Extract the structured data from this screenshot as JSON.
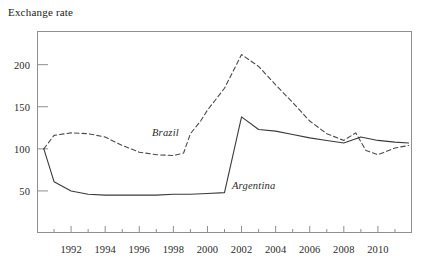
{
  "chart_data": {
    "type": "line",
    "title": "Exchange rate",
    "xlabel": "",
    "ylabel": "Exchange rate",
    "xlim": [
      1990.0,
      2012.0
    ],
    "ylim": [
      0,
      240
    ],
    "grid": false,
    "legend_position": "inline-annotation",
    "y_ticks": [
      50,
      100,
      150,
      200
    ],
    "y_tick_labels": [
      "50",
      "100",
      "150",
      "200"
    ],
    "x_ticks": [
      1991,
      1992,
      1993,
      1994,
      1995,
      1996,
      1997,
      1998,
      1999,
      2000,
      2001,
      2002,
      2003,
      2004,
      2005,
      2006,
      2007,
      2008,
      2009,
      2010,
      2011
    ],
    "x_tick_labels": [
      "1992",
      "1994",
      "1996",
      "1998",
      "2000",
      "2002",
      "2004",
      "2006",
      "2008",
      "2010"
    ],
    "x_labeled_ticks": [
      1992,
      1994,
      1996,
      1998,
      2000,
      2002,
      2004,
      2006,
      2008,
      2010
    ],
    "series": [
      {
        "name": "Brazil",
        "style": "dashed",
        "color": "#4a4a4a",
        "x": [
          1990.4,
          1991.0,
          1992.0,
          1993.0,
          1994.0,
          1995.0,
          1996.0,
          1997.0,
          1998.0,
          1998.6,
          1999.0,
          1999.6,
          2000.0,
          2001.0,
          2002.0,
          2003.0,
          2004.0,
          2005.0,
          2006.0,
          2007.0,
          2008.0,
          2008.7,
          2009.3,
          2010.0,
          2011.0,
          2011.8
        ],
        "values": [
          100,
          116,
          119,
          118,
          114,
          104,
          96,
          93,
          92,
          95,
          118,
          133,
          146,
          172,
          212,
          198,
          176,
          155,
          133,
          118,
          110,
          119,
          98,
          93,
          101,
          104
        ]
      },
      {
        "name": "Argentina",
        "style": "solid",
        "color": "#3a3a3a",
        "x": [
          1990.4,
          1991.0,
          1992.0,
          1993.0,
          1994.0,
          1995.0,
          1996.0,
          1997.0,
          1998.0,
          1999.0,
          2000.0,
          2001.0,
          2002.0,
          2003.0,
          2004.0,
          2005.0,
          2006.0,
          2007.0,
          2008.0,
          2009.0,
          2010.0,
          2011.0,
          2011.8
        ],
        "values": [
          100,
          61,
          50,
          46,
          45,
          45,
          45,
          45,
          46,
          46,
          47,
          48,
          138,
          123,
          121,
          117,
          113,
          110,
          107,
          114,
          110,
          108,
          107
        ]
      }
    ],
    "annotations": [
      {
        "text": "Brazil",
        "x_px": 152,
        "y_px": 127
      },
      {
        "text": "Argentina",
        "x_px": 232,
        "y_px": 180
      }
    ]
  },
  "geometry": {
    "plot_left_px": 37,
    "plot_right_px": 412,
    "plot_top_px": 31,
    "plot_bottom_px": 233,
    "y_value_at_top_px": 240,
    "y_value_at_bottom_px": 0
  }
}
